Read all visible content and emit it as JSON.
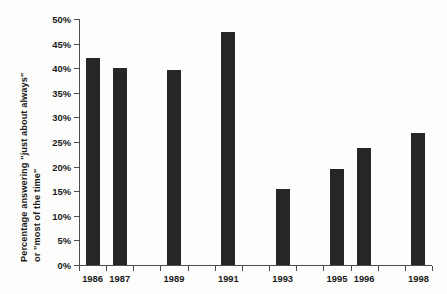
{
  "chart_data": {
    "type": "bar",
    "title": "",
    "subtitle": "",
    "xlabel": "",
    "ylabel": "Percentage answering \"just about always\" or \"most of the time\"",
    "ylabel_lines": [
      "Percentage answering \"just about always\"",
      "or \"most of the time\""
    ],
    "categories": [
      "1986",
      "1987",
      "1989",
      "1991",
      "1993",
      "1995",
      "1996",
      "1998"
    ],
    "values": [
      42.0,
      40.0,
      39.6,
      47.3,
      15.4,
      19.6,
      23.7,
      26.8
    ],
    "value_unit": "%",
    "ylim": [
      0,
      50
    ],
    "ytick_values": [
      0,
      5,
      10,
      15,
      20,
      25,
      30,
      35,
      40,
      45,
      50
    ],
    "ytick_labels": [
      "0%",
      "5%",
      "10%",
      "15%",
      "20%",
      "25%",
      "30%",
      "35%",
      "40%",
      "45%",
      "50%"
    ],
    "xtick_slots": [
      "1986",
      "1987",
      "1988",
      "1989",
      "1990",
      "1991",
      "1992",
      "1993",
      "1994",
      "1995",
      "1996",
      "1997",
      "1998"
    ],
    "xtick_labeled": [
      "1986",
      "1987",
      "1989",
      "1991",
      "1993",
      "1995",
      "1996",
      "1998"
    ],
    "grid": false,
    "legend": false,
    "legend_position": "none",
    "bar_color": "#262626",
    "axis_color": "#4d4d4d",
    "text_color": "#1a1a1a",
    "background_color": "#fdfdfc"
  }
}
